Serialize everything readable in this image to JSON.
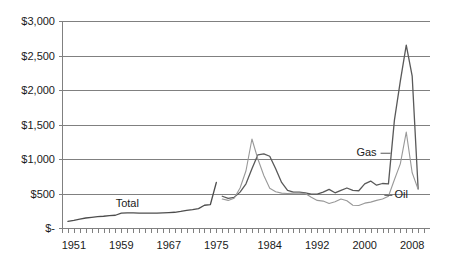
{
  "chart_data": {
    "type": "line",
    "title": "",
    "subtitle": "",
    "xlabel": "",
    "ylabel": "",
    "xlim": [
      1949,
      2011
    ],
    "ylim": [
      0,
      3000
    ],
    "grid": true,
    "legend_position": "inline-annotations",
    "y_tick_labels": [
      "$3,000",
      "$2,500",
      "$2,000",
      "$1,500",
      "$1,000",
      "$500",
      "$-"
    ],
    "y_tick_values": [
      3000,
      2500,
      2000,
      1500,
      1000,
      500,
      0
    ],
    "x_tick_labels": [
      "1951",
      "1959",
      "1967",
      "1975",
      "1984",
      "1992",
      "2000",
      "2008"
    ],
    "x_tick_values": [
      1951,
      1959,
      1967,
      1975,
      1984,
      1992,
      2000,
      2008
    ],
    "x_minor_tick_interval": 1,
    "series": [
      {
        "name": "Total",
        "color": "#4d4d4d",
        "label_text": "Total",
        "label_x": 1960,
        "label_y": 300,
        "x": [
          1950,
          1951,
          1952,
          1953,
          1954,
          1955,
          1956,
          1957,
          1958,
          1959,
          1960,
          1961,
          1962,
          1963,
          1964,
          1965,
          1966,
          1967,
          1968,
          1969,
          1970,
          1971,
          1972,
          1973,
          1974,
          1975
        ],
        "values": [
          95,
          110,
          130,
          145,
          155,
          165,
          170,
          180,
          185,
          215,
          220,
          218,
          216,
          215,
          215,
          215,
          218,
          222,
          228,
          240,
          255,
          265,
          280,
          330,
          340,
          660
        ]
      },
      {
        "name": "Gas",
        "color": "#595959",
        "label_text": "Gas",
        "label_x": 2002,
        "label_y": 1040,
        "x": [
          1976,
          1977,
          1978,
          1979,
          1980,
          1981,
          1982,
          1983,
          1984,
          1985,
          1986,
          1987,
          1988,
          1989,
          1990,
          1991,
          1992,
          1993,
          1994,
          1995,
          1996,
          1997,
          1998,
          1999,
          2000,
          2001,
          2002,
          2003,
          2004,
          2005,
          2006,
          2007,
          2008,
          2009
        ],
        "values": [
          460,
          430,
          445,
          520,
          640,
          860,
          1060,
          1075,
          1040,
          860,
          660,
          545,
          520,
          520,
          510,
          490,
          490,
          520,
          560,
          510,
          545,
          580,
          545,
          540,
          640,
          680,
          620,
          645,
          640,
          1560,
          2130,
          2650,
          2200,
          570
        ]
      },
      {
        "name": "Oil",
        "color": "#999999",
        "label_text": "Oil",
        "label_x": 2005,
        "label_y": 430,
        "x": [
          1976,
          1977,
          1978,
          1979,
          1980,
          1981,
          1982,
          1983,
          1984,
          1985,
          1986,
          1987,
          1988,
          1989,
          1990,
          1991,
          1992,
          1993,
          1994,
          1995,
          1996,
          1997,
          1998,
          1999,
          2000,
          2001,
          2002,
          2003,
          2004,
          2005,
          2006,
          2007,
          2008,
          2009
        ],
        "values": [
          420,
          400,
          430,
          580,
          830,
          1290,
          1000,
          760,
          575,
          525,
          505,
          500,
          505,
          505,
          500,
          445,
          400,
          390,
          355,
          380,
          420,
          395,
          330,
          325,
          360,
          375,
          400,
          420,
          460,
          700,
          930,
          1390,
          800,
          560
        ]
      }
    ],
    "annotations": [
      {
        "text": "Total",
        "series": "Total"
      },
      {
        "text": "Gas",
        "series": "Gas"
      },
      {
        "text": "Oil",
        "series": "Oil"
      }
    ]
  },
  "plot": {
    "left_px": 62,
    "right_px": 430,
    "top_px": 21,
    "bottom_px": 228
  },
  "colors": {
    "grid": "#808080",
    "axis": "#808080",
    "text": "#1a1a1a",
    "background": "#ffffff"
  }
}
